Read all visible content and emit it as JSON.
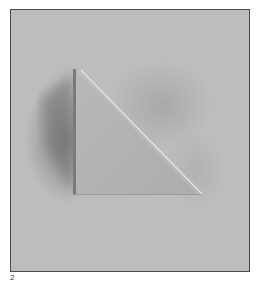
{
  "figure": {
    "label": "2",
    "colors": {
      "background": "#bdbdbd",
      "triangle_face": "#b4b4b4",
      "vertical_edge": "#7a7a7a",
      "hypotenuse_highlight": "#e6e6e6",
      "shadow": "#6a6a6a",
      "frame_border": "#4a4a4a"
    }
  }
}
